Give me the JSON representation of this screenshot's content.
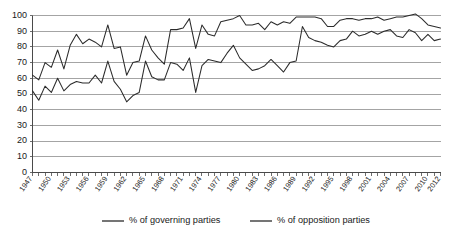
{
  "chart_data": {
    "type": "line",
    "title": "",
    "subtitle": "",
    "xlabel": "",
    "ylabel": "",
    "ylim": [
      0,
      100
    ],
    "ytick_step": 10,
    "ytick_labels": [
      "0",
      "10",
      "20",
      "30",
      "40",
      "50",
      "60",
      "70",
      "80",
      "90",
      "100"
    ],
    "grid": true,
    "grid_axis": "y",
    "legend_position": "bottom",
    "x_start_year": 1947,
    "x_end_year": 2012,
    "x_tick_labels": [
      "1947",
      "1950",
      "1953",
      "1956",
      "1959",
      "1962",
      "1965",
      "1968",
      "1971",
      "1974",
      "1977",
      "1980",
      "1983",
      "1986",
      "1989",
      "1992",
      "1995",
      "1998",
      "2001",
      "2004",
      "2007",
      "2010",
      "2012"
    ],
    "x_tick_years": [
      1947,
      1950,
      1953,
      1956,
      1959,
      1962,
      1965,
      1968,
      1971,
      1974,
      1977,
      1980,
      1983,
      1986,
      1989,
      1992,
      1995,
      1998,
      2001,
      2004,
      2007,
      2010,
      2012
    ],
    "x": [
      1947,
      1948,
      1949,
      1950,
      1951,
      1952,
      1953,
      1954,
      1955,
      1956,
      1957,
      1958,
      1959,
      1960,
      1961,
      1962,
      1963,
      1964,
      1965,
      1966,
      1967,
      1968,
      1969,
      1970,
      1971,
      1972,
      1973,
      1974,
      1975,
      1976,
      1977,
      1978,
      1979,
      1980,
      1981,
      1982,
      1983,
      1984,
      1985,
      1986,
      1987,
      1988,
      1989,
      1990,
      1991,
      1992,
      1993,
      1994,
      1995,
      1996,
      1997,
      1998,
      1999,
      2000,
      2001,
      2002,
      2003,
      2004,
      2005,
      2006,
      2007,
      2008,
      2009,
      2010,
      2011,
      2012
    ],
    "series": [
      {
        "name": "% of governing parties",
        "color": "#2b2b2b",
        "values": [
          62,
          59,
          70,
          67,
          78,
          66,
          81,
          88,
          82,
          85,
          83,
          80,
          94,
          79,
          80,
          62,
          70,
          71,
          87,
          78,
          73,
          69,
          91,
          91,
          92,
          98,
          79,
          94,
          88,
          87,
          96,
          97,
          98,
          100,
          94,
          94,
          95,
          91,
          96,
          94,
          96,
          95,
          99,
          99,
          99,
          99,
          98,
          93,
          93,
          97,
          98,
          98,
          97,
          98,
          98,
          99,
          97,
          98,
          99,
          99,
          100,
          101,
          98,
          94,
          93,
          92
        ]
      },
      {
        "name": "% of opposition parties",
        "color": "#2b2b2b",
        "values": [
          52,
          46,
          55,
          51,
          60,
          52,
          56,
          58,
          57,
          57,
          62,
          57,
          71,
          58,
          53,
          45,
          49,
          51,
          71,
          61,
          59,
          59,
          70,
          69,
          65,
          73,
          51,
          68,
          72,
          71,
          70,
          76,
          81,
          73,
          69,
          65,
          66,
          68,
          72,
          68,
          64,
          70,
          71,
          93,
          86,
          84,
          83,
          81,
          80,
          84,
          85,
          90,
          87,
          88,
          90,
          88,
          90,
          91,
          87,
          86,
          91,
          89,
          84,
          88,
          84,
          85
        ]
      }
    ]
  },
  "legend": {
    "items": [
      {
        "label": "% of governing parties"
      },
      {
        "label": "% of opposition parties"
      }
    ]
  }
}
